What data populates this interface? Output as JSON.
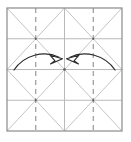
{
  "figure": {
    "canvas": {
      "width": 131,
      "height": 142
    },
    "colors": {
      "background": "#ffffff",
      "border": "#8a8a8a",
      "solid_crease": "#b0b0b0",
      "diagonal_crease": "#b5b5b5",
      "dashed_crease": "#8f8f8f",
      "arrow": "#2b2b2b",
      "vertex": "#555555"
    },
    "square": {
      "left": 7,
      "top": 8,
      "right": 122,
      "bottom": 131
    }
  },
  "geometry": {
    "outer_border": {
      "label": "paper-edge",
      "x1": 7,
      "y1": 8,
      "x2": 122,
      "y2": 131
    },
    "vertical_lines": [
      {
        "label": "quarter-left-dashed",
        "x": 35.75,
        "style": "dashed"
      },
      {
        "label": "center-vertical",
        "x": 64.5,
        "style": "solid"
      },
      {
        "label": "quarter-right-dashed",
        "x": 93.25,
        "style": "dashed"
      }
    ],
    "horizontal_lines": [
      {
        "label": "quarter-top",
        "y": 38.75,
        "style": "solid"
      },
      {
        "label": "center-horizontal",
        "y": 69.5,
        "style": "solid"
      },
      {
        "label": "quarter-bottom",
        "y": 100.25,
        "style": "solid"
      }
    ],
    "diagonals": [
      {
        "label": "q1-diag-down",
        "x1": 7,
        "y1": 8,
        "x2": 64.5,
        "y2": 69.5
      },
      {
        "label": "q1-diag-up",
        "x1": 64.5,
        "y1": 8,
        "x2": 7,
        "y2": 69.5
      },
      {
        "label": "q2-diag-down",
        "x1": 64.5,
        "y1": 8,
        "x2": 122,
        "y2": 69.5
      },
      {
        "label": "q2-diag-up",
        "x1": 122,
        "y1": 8,
        "x2": 64.5,
        "y2": 69.5
      },
      {
        "label": "q3-diag-down",
        "x1": 7,
        "y1": 69.5,
        "x2": 64.5,
        "y2": 131
      },
      {
        "label": "q3-diag-up",
        "x1": 64.5,
        "y1": 69.5,
        "x2": 7,
        "y2": 131
      },
      {
        "label": "q4-diag-down",
        "x1": 64.5,
        "y1": 69.5,
        "x2": 122,
        "y2": 131
      },
      {
        "label": "q4-diag-up",
        "x1": 122,
        "y1": 69.5,
        "x2": 64.5,
        "y2": 131
      }
    ],
    "vertices": [
      {
        "label": "vertex-top-left-quad",
        "x": 35.75,
        "y": 38.75
      },
      {
        "label": "vertex-top-right-quad",
        "x": 93.25,
        "y": 38.75
      },
      {
        "label": "vertex-center",
        "x": 64.5,
        "y": 69.5
      },
      {
        "label": "vertex-bottom-left-quad",
        "x": 35.75,
        "y": 100.25
      },
      {
        "label": "vertex-bottom-right-quad",
        "x": 93.25,
        "y": 100.25
      }
    ],
    "arrows": [
      {
        "label": "left-fold-arrow",
        "direction": "right",
        "path": "M 14 70 C 24 55 44 50 60 57",
        "head": "M 60 57 L 62 62.5 L 51.5 57.5 Z"
      },
      {
        "label": "right-fold-arrow",
        "direction": "left",
        "path": "M 115 70 C 105 55 85 50 69 57",
        "head": "M 69 57 L 67 62.5 L 77.5 57.5 Z"
      }
    ]
  }
}
